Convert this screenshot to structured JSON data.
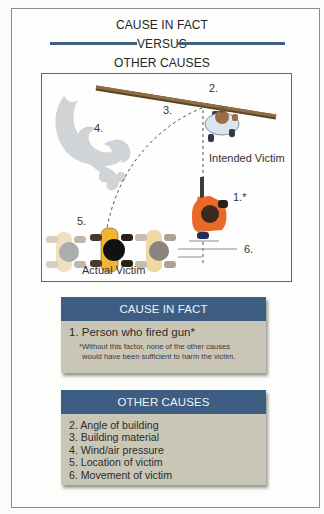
{
  "title": {
    "line1": "CAUSE IN FACT",
    "line2": "VERSUS",
    "line3": "OTHER CAUSES",
    "rule_color": "#3f5f80"
  },
  "diagram": {
    "labels": {
      "shooter": "1.*",
      "building": "2.",
      "material": "3.",
      "wind": "4.",
      "location": "5.",
      "movement": "6.",
      "intended_victim": "Intended Victim",
      "actual_victim": "Actual Victim"
    },
    "colors": {
      "beam": "#8a6a3e",
      "shooter_shirt": "#e8692a",
      "victim_shirt": "#f0b632",
      "intended_shirt": "#dde6ee",
      "wind": "#c9cccf"
    }
  },
  "cause_in_fact": {
    "header": "CAUSE IN FACT",
    "item": "1. Person who fired gun*",
    "footnote_line1": "*Without this factor, none of the other causes",
    "footnote_line2": "would have been sufficient to harm the victim.",
    "header_color": "#3e5d83",
    "body_color": "#c9c6b6"
  },
  "other_causes": {
    "header": "OTHER CAUSES",
    "items": [
      "2. Angle of building",
      "3. Building material",
      "4. Wind/air pressure",
      "5. Location of victim",
      "6. Movement of victim"
    ]
  }
}
